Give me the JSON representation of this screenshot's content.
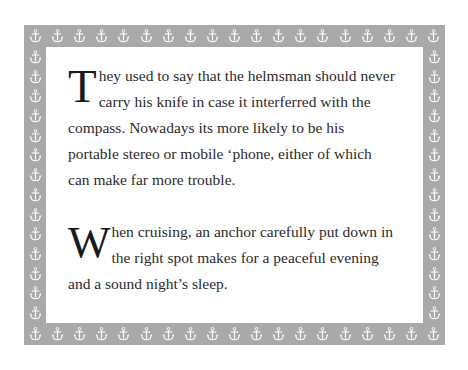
{
  "document": {
    "border": {
      "motif_icon": "anchor-icon",
      "motif_color": "#ffffff",
      "background_color": "#a9a9a9",
      "top_count": 19,
      "bottom_count": 19,
      "left_count": 14,
      "right_count": 14
    },
    "panel": {
      "background_color": "#ffffff"
    },
    "paragraphs": [
      {
        "dropcap": "T",
        "text": "hey used to say that the helmsman should never carry his knife in case it interferred with the compass. Nowadays its more likely to be his portable stereo or mobile ‘phone, either of which can make far more trouble."
      },
      {
        "dropcap": "W",
        "text": "hen cruising, an anchor carefully put down in the right spot makes for a peaceful evening and a sound night’s sleep."
      }
    ],
    "text_color": "#2b2b2b"
  }
}
